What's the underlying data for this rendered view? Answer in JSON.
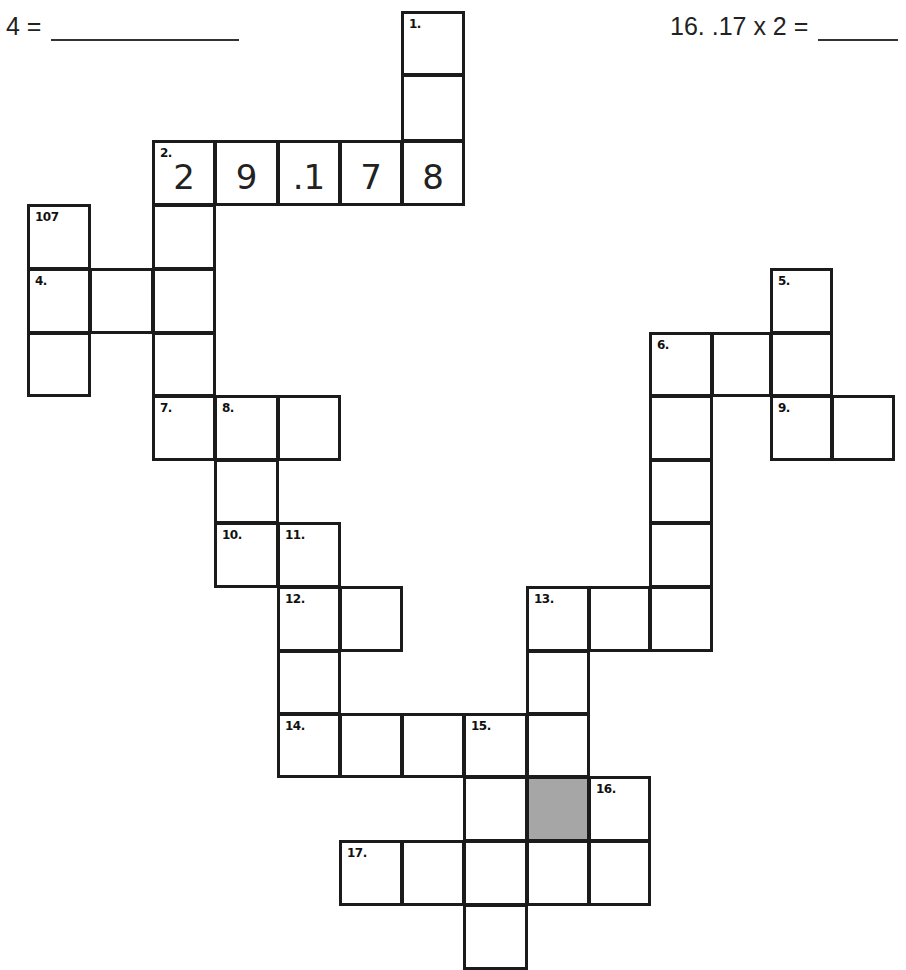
{
  "clues_visible": [
    {
      "id": "clue-4",
      "text": "4 =",
      "x": 6,
      "y": 12,
      "blank_width": 188
    },
    {
      "id": "clue-16",
      "text": "16.  .17 x 2 =",
      "x": 670,
      "y": 12,
      "blank_width": 80
    }
  ],
  "colors": {
    "line": "#1b1b1b",
    "shaded": "#a6a6a6",
    "background": "#ffffff"
  },
  "grid": {
    "col_x": [
      28,
      90,
      153,
      215,
      278,
      340,
      402,
      464,
      527,
      589,
      650,
      712,
      771,
      832
    ],
    "row_y": [
      12,
      75,
      141,
      205,
      269,
      333,
      396,
      460,
      523,
      587,
      651,
      714,
      777,
      841,
      905
    ],
    "cells": [
      {
        "c": 6,
        "r": 0,
        "num": "1."
      },
      {
        "c": 6,
        "r": 1
      },
      {
        "c": 2,
        "r": 2,
        "num": "2.",
        "val": "2"
      },
      {
        "c": 3,
        "r": 2,
        "val": "9"
      },
      {
        "c": 4,
        "r": 2,
        "val": ".1"
      },
      {
        "c": 5,
        "r": 2,
        "val": "7"
      },
      {
        "c": 6,
        "r": 2,
        "val": "8"
      },
      {
        "c": 0,
        "r": 3,
        "num": "107"
      },
      {
        "c": 2,
        "r": 3
      },
      {
        "c": 0,
        "r": 4,
        "num": "4."
      },
      {
        "c": 1,
        "r": 4
      },
      {
        "c": 2,
        "r": 4
      },
      {
        "c": 0,
        "r": 5
      },
      {
        "c": 2,
        "r": 5
      },
      {
        "c": 2,
        "r": 6,
        "num": "7."
      },
      {
        "c": 3,
        "r": 6,
        "num": "8."
      },
      {
        "c": 4,
        "r": 6
      },
      {
        "c": 3,
        "r": 7
      },
      {
        "c": 3,
        "r": 8,
        "num": "10."
      },
      {
        "c": 4,
        "r": 8,
        "num": "11."
      },
      {
        "c": 4,
        "r": 9,
        "num": "12."
      },
      {
        "c": 5,
        "r": 9
      },
      {
        "c": 4,
        "r": 10
      },
      {
        "c": 4,
        "r": 11,
        "num": "14."
      },
      {
        "c": 5,
        "r": 11
      },
      {
        "c": 6,
        "r": 11
      },
      {
        "c": 7,
        "r": 11,
        "num": "15."
      },
      {
        "c": 8,
        "r": 11
      },
      {
        "c": 7,
        "r": 12
      },
      {
        "c": 8,
        "r": 12,
        "shaded": true
      },
      {
        "c": 9,
        "r": 12,
        "num": "16."
      },
      {
        "c": 5,
        "r": 13,
        "num": "17."
      },
      {
        "c": 6,
        "r": 13
      },
      {
        "c": 7,
        "r": 13
      },
      {
        "c": 8,
        "r": 13
      },
      {
        "c": 9,
        "r": 13
      },
      {
        "c": 7,
        "r": 14
      },
      {
        "c": 8,
        "r": 9,
        "num": "13."
      },
      {
        "c": 9,
        "r": 9
      },
      {
        "c": 10,
        "r": 9
      },
      {
        "c": 8,
        "r": 10
      },
      {
        "c": 12,
        "r": 4,
        "num": "5."
      },
      {
        "c": 10,
        "r": 5,
        "num": "6."
      },
      {
        "c": 11,
        "r": 5
      },
      {
        "c": 12,
        "r": 5
      },
      {
        "c": 10,
        "r": 6
      },
      {
        "c": 12,
        "r": 6,
        "num": "9."
      },
      {
        "c": 13,
        "r": 6
      },
      {
        "c": 10,
        "r": 7
      },
      {
        "c": 10,
        "r": 8
      }
    ]
  }
}
